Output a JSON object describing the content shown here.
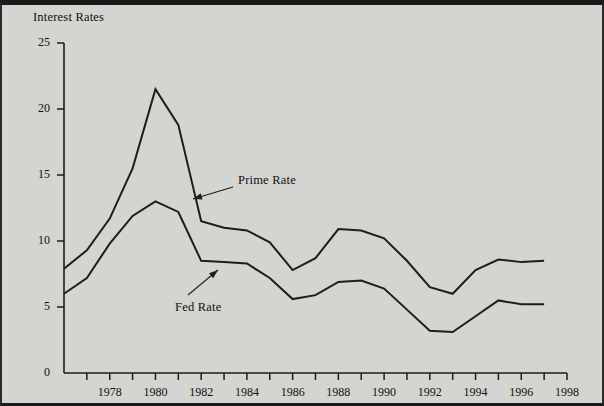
{
  "figure": {
    "background_color": "#d4d4d0",
    "line_color": "#1d1d1d",
    "text_color": "#111111"
  },
  "chart_data": {
    "type": "line",
    "title": "",
    "ylabel": "Interest Rates",
    "xlabel": "",
    "xlim": [
      1976,
      1998
    ],
    "ylim": [
      0,
      25
    ],
    "grid": false,
    "legend_position": "inline-annotation",
    "x": [
      1976,
      1977,
      1978,
      1979,
      1980,
      1981,
      1982,
      1983,
      1984,
      1985,
      1986,
      1987,
      1988,
      1989,
      1990,
      1991,
      1992,
      1993,
      1994,
      1995,
      1996,
      1997
    ],
    "xticks": [
      1976,
      1977,
      1978,
      1979,
      1980,
      1981,
      1982,
      1983,
      1984,
      1985,
      1986,
      1987,
      1988,
      1989,
      1990,
      1991,
      1992,
      1993,
      1994,
      1995,
      1996,
      1997,
      1998
    ],
    "xtick_labels": [
      "",
      "",
      "1978",
      "",
      "1980",
      "",
      "1982",
      "",
      "1984",
      "",
      "1986",
      "",
      "1988",
      "",
      "1990",
      "",
      "1992",
      "",
      "1994",
      "",
      "1996",
      "",
      "1998"
    ],
    "yticks": [
      0,
      5,
      10,
      15,
      20,
      25
    ],
    "ytick_labels": [
      "0",
      "5",
      "10",
      "15",
      "20",
      "25"
    ],
    "series": [
      {
        "name": "Prime Rate",
        "values": [
          7.9,
          9.3,
          11.7,
          15.5,
          21.5,
          18.8,
          11.5,
          11.0,
          10.8,
          9.9,
          7.8,
          8.7,
          10.9,
          10.8,
          10.2,
          8.5,
          6.5,
          6.0,
          7.8,
          8.6,
          8.4,
          8.5
        ]
      },
      {
        "name": "Fed Rate",
        "values": [
          6.0,
          7.2,
          9.8,
          11.9,
          13.0,
          12.2,
          8.5,
          8.4,
          8.3,
          7.2,
          5.6,
          5.9,
          6.9,
          7.0,
          6.4,
          4.8,
          3.2,
          3.1,
          4.3,
          5.5,
          5.2,
          5.2
        ]
      }
    ],
    "annotations": [
      {
        "text": "Prime Rate",
        "label_x": 236,
        "label_y": 168,
        "arrow_from_x": 231,
        "arrow_from_y": 182,
        "arrow_to_x": 191,
        "arrow_to_y": 194
      },
      {
        "text": "Fed Rate",
        "label_x": 173,
        "label_y": 295,
        "arrow_from_x": 186,
        "arrow_from_y": 290,
        "arrow_to_x": 216,
        "arrow_to_y": 265
      }
    ]
  }
}
